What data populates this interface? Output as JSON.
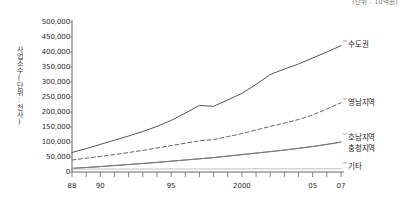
{
  "unit_note": "(단위 : 10억원)",
  "y_axis_title": "사업소수(단위:천사)",
  "axis": {
    "y_ticks": [
      "0",
      "50,000",
      "100,000",
      "150,000",
      "200,000",
      "250,000",
      "300,000",
      "350,000",
      "400,000",
      "450,000",
      "500,000"
    ],
    "x_ticks": [
      "88",
      "90",
      "95",
      "2000",
      "05",
      "07"
    ]
  },
  "series_labels": {
    "sudogwon": "수도권",
    "yeongnam": "영남지역",
    "honam": "호남지역",
    "chungcheong": "충청지역",
    "gita": "기타"
  },
  "chart_data": {
    "type": "line",
    "title": "",
    "subtitle": "",
    "xlabel": "",
    "ylabel": "사업소수(단위:천사)",
    "unit_note": "(단위 : 10억원)",
    "grid": false,
    "legend_position": "right-inline",
    "xlim": [
      1988,
      2007
    ],
    "ylim": [
      0,
      500000
    ],
    "y_tick_step": 50000,
    "x_tick_labels": {
      "1988": "88",
      "1990": "90",
      "1995": "95",
      "2000": "2000",
      "2005": "05",
      "2007": "07"
    },
    "x": [
      1988,
      1989,
      1990,
      1991,
      1992,
      1993,
      1994,
      1995,
      1996,
      1997,
      1998,
      1999,
      2000,
      2001,
      2002,
      2003,
      2004,
      2005,
      2006,
      2007
    ],
    "series": [
      {
        "name": "수도권",
        "style": "solid",
        "color": "#555555",
        "values": [
          65000,
          78000,
          92000,
          106000,
          120000,
          135000,
          152000,
          172000,
          196000,
          222000,
          219000,
          240000,
          262000,
          292000,
          325000,
          343000,
          360000,
          380000,
          400000,
          421000
        ]
      },
      {
        "name": "영남지역",
        "style": "dashed",
        "color": "#666666",
        "values": [
          40000,
          46000,
          52000,
          58000,
          65000,
          72000,
          80000,
          88000,
          96000,
          104000,
          108000,
          118000,
          128000,
          140000,
          152000,
          163000,
          175000,
          190000,
          210000,
          231000
        ]
      },
      {
        "name": "호남지역",
        "style": "solid",
        "color": "#4a4a4a",
        "values": [
          12000,
          15000,
          18000,
          21500,
          25000,
          28500,
          32000,
          36000,
          40000,
          44000,
          48000,
          53000,
          58000,
          63000,
          68000,
          73000,
          79000,
          85000,
          92000,
          100000
        ]
      },
      {
        "name": "충청지역",
        "style": "dotted",
        "color": "#8a8a8a",
        "values": [
          12000,
          15000,
          18000,
          21500,
          25000,
          28500,
          32000,
          36000,
          40000,
          44000,
          48000,
          53000,
          58000,
          63000,
          68000,
          73000,
          79000,
          85000,
          92000,
          99000
        ]
      },
      {
        "name": "기타",
        "style": "solid",
        "color": "#c0c0c0",
        "values": [
          9500,
          9600,
          9700,
          9800,
          9900,
          10000,
          10000,
          10100,
          10100,
          10200,
          10200,
          10300,
          10300,
          10400,
          10400,
          10500,
          10500,
          10600,
          10600,
          10700
        ]
      }
    ]
  }
}
